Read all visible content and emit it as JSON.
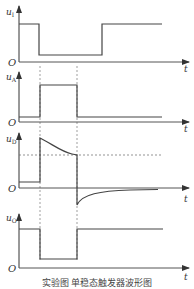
{
  "diagram": {
    "type": "timing-waveform",
    "caption": "实验图  单稳态触发器波形图",
    "time_axis_label": "t",
    "origin_label": "O",
    "panels": [
      {
        "id": "uI",
        "label_main": "u",
        "label_sub": "I",
        "signal": "input trigger: high, negative pulse low, then high"
      },
      {
        "id": "uA",
        "label_main": "u",
        "label_sub": "A",
        "signal": "positive pulse during trigger window"
      },
      {
        "id": "uD",
        "label_main": "u",
        "label_sub": "D",
        "signal": "jump up then exponential decay to threshold, negative spike then exponential recovery"
      },
      {
        "id": "uO",
        "label_main": "u",
        "label_sub": "O",
        "signal": "output: high, low during window, high"
      }
    ],
    "threshold_line": "dashed horizontal in u_D panel",
    "markers": [
      "t1 dashed vertical at trigger edge",
      "t2 dashed vertical at end of pulse"
    ]
  }
}
